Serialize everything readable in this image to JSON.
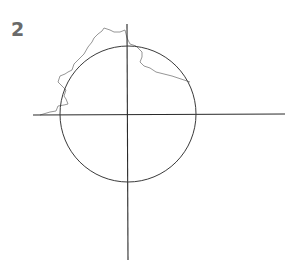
{
  "figure": {
    "label": "2",
    "colors": {
      "axes": "#2a2a2a",
      "circle": "#3a3a3a",
      "coastline": "#8a8a8a",
      "label": "#6a6a6a"
    },
    "circle": {
      "cx": 128,
      "cy": 114,
      "r": 68
    },
    "axes": {
      "horizontal": {
        "x1": 33,
        "x2": 285,
        "y": 115
      },
      "vertical": {
        "x": 127,
        "y1": 24,
        "y2": 260
      }
    }
  }
}
